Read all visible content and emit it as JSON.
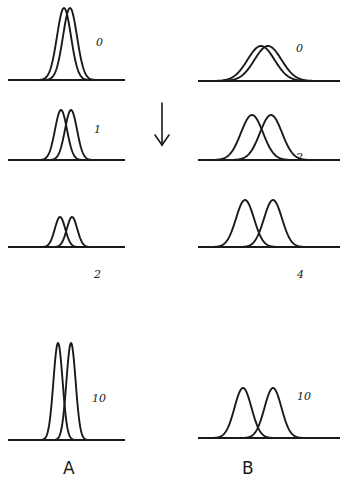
{
  "figure": {
    "panels": [
      {
        "id": "A",
        "label": "A",
        "label_pos": [
          63,
          474
        ],
        "baseline_x": [
          8,
          125
        ],
        "rows": [
          {
            "value": "0",
            "baseline_y": 80,
            "peak_height": 71,
            "centers": [
              64,
              70
            ],
            "sigma": 7.0,
            "label_pos": [
              96,
              46
            ]
          },
          {
            "value": "1",
            "baseline_y": 160,
            "peak_height": 50,
            "centers": [
              61,
              71
            ],
            "sigma": 6.0,
            "label_pos": [
              94,
              133
            ]
          },
          {
            "value": "2",
            "baseline_y": 247,
            "peak_height": 30,
            "centers": [
              60,
              72
            ],
            "sigma": 5.2,
            "label_pos": [
              94,
              278
            ]
          },
          {
            "value": "10",
            "baseline_y": 440,
            "peak_height": 97,
            "centers": [
              58,
              71
            ],
            "sigma": 4.6,
            "label_pos": [
              92,
              402
            ]
          }
        ]
      },
      {
        "id": "B",
        "label": "B",
        "label_pos": [
          242,
          474
        ],
        "baseline_x": [
          198,
          340
        ],
        "rows": [
          {
            "value": "0",
            "baseline_y": 81,
            "peak_height": 36,
            "centers": [
              261,
              268
            ],
            "sigma": 13.5,
            "label_pos": [
              296,
              52
            ]
          },
          {
            "value": "2",
            "baseline_y": 160,
            "peak_height": 40,
            "centers": [
              252,
              271
            ],
            "sigma": 11.0,
            "label_pos": [
              296,
              161
            ]
          },
          {
            "value": "4",
            "baseline_y": 247,
            "peak_height": 47,
            "centers": [
              245,
              273
            ],
            "sigma": 9.0,
            "label_pos": [
              297,
              278
            ]
          },
          {
            "value": "10",
            "baseline_y": 438,
            "peak_height": 50,
            "centers": [
              243,
              273
            ],
            "sigma": 8.5,
            "label_pos": [
              297,
              400
            ]
          }
        ]
      }
    ],
    "arrow": {
      "x": 162,
      "y1": 103,
      "y2": 145,
      "direction": "down",
      "icon": "down-arrow-icon"
    }
  }
}
